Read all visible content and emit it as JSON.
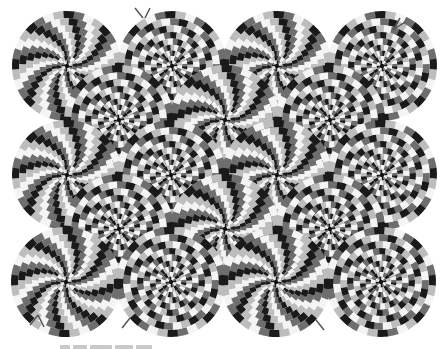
{
  "image": {
    "title": "Rotating snakes optical illusion",
    "width": 445,
    "height": 349,
    "background": "#ffffff"
  },
  "palette": {
    "black": "#1a1a1a",
    "dark_gray": "#6e6e6e",
    "white": "#f4f4f4",
    "light_gray": "#bdbdbd"
  },
  "disc": {
    "outer_radius": 55,
    "rings": 9,
    "segments": 32
  },
  "discs": [
    {
      "row": 1,
      "cx": 67,
      "cy": 66,
      "dir": 1
    },
    {
      "row": 1,
      "cx": 172,
      "cy": 66,
      "dir": -1
    },
    {
      "row": 1,
      "cx": 277,
      "cy": 66,
      "dir": 1
    },
    {
      "row": 1,
      "cx": 382,
      "cy": 66,
      "dir": -1
    },
    {
      "row": 2,
      "cx": 119,
      "cy": 120,
      "dir": -1
    },
    {
      "row": 2,
      "cx": 225,
      "cy": 120,
      "dir": 1
    },
    {
      "row": 2,
      "cx": 330,
      "cy": 120,
      "dir": -1
    },
    {
      "row": 3,
      "cx": 67,
      "cy": 175,
      "dir": 1
    },
    {
      "row": 3,
      "cx": 171,
      "cy": 175,
      "dir": -1
    },
    {
      "row": 3,
      "cx": 277,
      "cy": 175,
      "dir": 1
    },
    {
      "row": 3,
      "cx": 382,
      "cy": 175,
      "dir": -1
    },
    {
      "row": 4,
      "cx": 119,
      "cy": 229,
      "dir": -1
    },
    {
      "row": 4,
      "cx": 225,
      "cy": 229,
      "dir": 1
    },
    {
      "row": 4,
      "cx": 330,
      "cy": 229,
      "dir": -1
    },
    {
      "row": 5,
      "cx": 66,
      "cy": 282,
      "dir": 1
    },
    {
      "row": 5,
      "cx": 171,
      "cy": 282,
      "dir": -1
    },
    {
      "row": 5,
      "cx": 276,
      "cy": 282,
      "dir": 1
    },
    {
      "row": 5,
      "cx": 381,
      "cy": 282,
      "dir": -1
    }
  ]
}
